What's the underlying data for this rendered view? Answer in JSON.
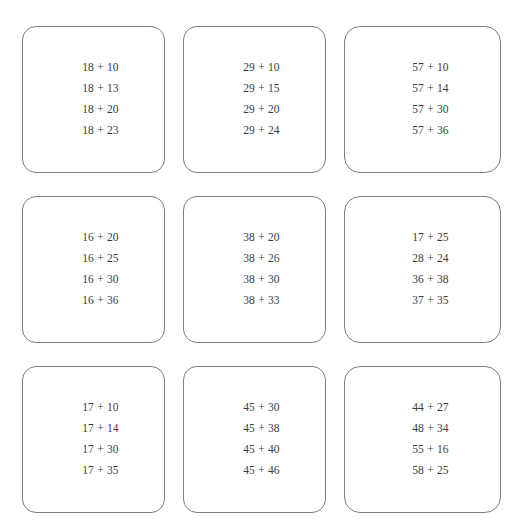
{
  "worksheet": {
    "title": "Addition Practice Cards",
    "background_color": "#ffffff",
    "card_border_color": "#7d7d80",
    "text_color": "#3c3c3f",
    "columns": 3,
    "rows": 3,
    "card_count": 9
  },
  "cards": [
    {
      "id": "card-1",
      "position": "row1-col1",
      "problems": [
        "18 + 10",
        "18 + 13",
        "18 + 20",
        "18 + 23"
      ]
    },
    {
      "id": "card-2",
      "position": "row1-col2",
      "problems": [
        "29 + 10",
        "29 + 15",
        "29 + 20",
        "29 + 24"
      ]
    },
    {
      "id": "card-3",
      "position": "row1-col3",
      "problems": [
        "57 + 10",
        "57 + 14",
        "57 + 30",
        "57 + 36"
      ]
    },
    {
      "id": "card-4",
      "position": "row2-col1",
      "problems": [
        "16 + 20",
        "16 + 25",
        "16 + 30",
        "16 + 36"
      ]
    },
    {
      "id": "card-5",
      "position": "row2-col2",
      "problems": [
        "38 + 20",
        "38 + 26",
        "38 + 30",
        "38 + 33"
      ]
    },
    {
      "id": "card-6",
      "position": "row2-col3",
      "problems": [
        "17 + 25",
        "28 + 24",
        "36 + 38",
        "37 + 35"
      ]
    },
    {
      "id": "card-7",
      "position": "row3-col1",
      "problems": [
        "17 + 10",
        "17 + 14",
        "17 + 30",
        "17 + 35"
      ]
    },
    {
      "id": "card-8",
      "position": "row3-col2",
      "problems": [
        "45 + 30",
        "45 + 38",
        "45 + 40",
        "45 + 46"
      ]
    },
    {
      "id": "card-9",
      "position": "row3-col3",
      "problems": [
        "44 + 27",
        "48 + 34",
        "55 + 16",
        "58 + 25"
      ]
    }
  ]
}
